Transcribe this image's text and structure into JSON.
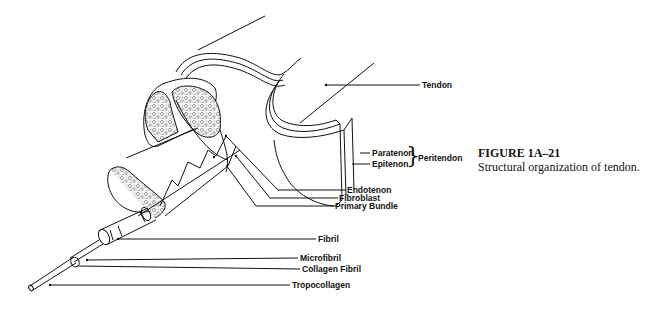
{
  "figure": {
    "title": "FIGURE 1A–21",
    "caption": "Structural organization of tendon."
  },
  "labels": {
    "tendon": "Tendon",
    "paratenon": "Paratenon",
    "epitenon": "Epitenon",
    "peritendon": "Peritendon",
    "brace": "}",
    "endotenon": "Endotenon",
    "fibroblast": "Fibroblast",
    "primary_bundle": "Primary Bundle",
    "fibril": "Fibril",
    "microfibril": "Microfibril",
    "collagen_fibril": "Collagen Fibril",
    "tropocollagen": "Tropocollagen"
  }
}
